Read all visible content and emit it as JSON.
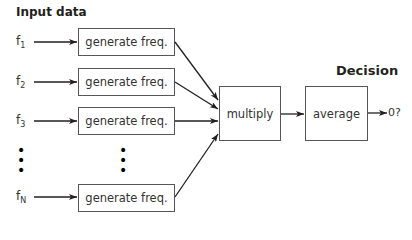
{
  "titles": {
    "input": "Input data",
    "decision": "Decision"
  },
  "inputs": [
    {
      "base": "f",
      "sub": "1"
    },
    {
      "base": "f",
      "sub": "2"
    },
    {
      "base": "f",
      "sub": "3"
    },
    {
      "base": "f",
      "sub": "N"
    }
  ],
  "generator_label": "generate freq.",
  "ellipsis": "•",
  "multiply_label": "multiply",
  "average_label": "average",
  "output_label": "0?"
}
